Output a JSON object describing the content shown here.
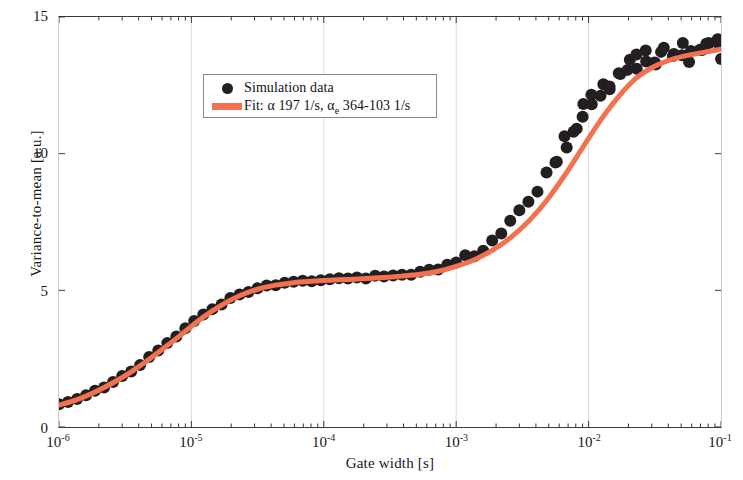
{
  "figure": {
    "background_color": "#ffffff",
    "frame_color": "#3a3a3a",
    "grid_color": "#dddddd"
  },
  "legend": {
    "position": "upper-left-inset",
    "entries": [
      {
        "key": "marker-dot",
        "label": "Simulation data",
        "color": "#231f20"
      },
      {
        "key": "line-swatch",
        "label": "Fit: α  197 1/s, α",
        "label_sub": "e",
        "label_tail": "  364-103 1/s",
        "color": "#F4714F"
      }
    ]
  },
  "chart_data": {
    "type": "scatter",
    "title": "",
    "subtitle": "",
    "xlabel": "Gate width [s]",
    "ylabel": "Variance-to-mean [a.u.]",
    "xscale": "log",
    "yscale": "linear",
    "xlim": [
      1e-06,
      0.1
    ],
    "ylim": [
      0,
      15
    ],
    "grid": "minor-vertical-faint",
    "xticks": [
      1e-06,
      1e-05,
      0.0001,
      0.001,
      0.01,
      0.1
    ],
    "xtick_labels": [
      "10-6",
      "10-5",
      "10-4",
      "10-3",
      "10-2",
      "10-1"
    ],
    "xtick_mantissa": [
      "10",
      "10",
      "10",
      "10",
      "10",
      "10"
    ],
    "xtick_exponents": [
      "-6",
      "-5",
      "-4",
      "-3",
      "-2",
      "-1"
    ],
    "yticks": [
      0,
      5,
      10,
      15
    ],
    "ytick_labels": [
      "0",
      "5",
      "10",
      "15"
    ],
    "series": [
      {
        "name": "Simulation data",
        "type": "scatter",
        "marker": "circle",
        "marker_size": 12,
        "color": "#231f20",
        "x": [
          1e-06,
          1.17e-06,
          1.37e-06,
          1.6e-06,
          1.87e-06,
          2.19e-06,
          2.56e-06,
          3e-06,
          3.51e-06,
          4.1e-06,
          4.8e-06,
          5.62e-06,
          6.58e-06,
          7.7e-06,
          9e-06,
          1.05e-05,
          1.23e-05,
          1.44e-05,
          1.69e-05,
          1.97e-05,
          2.31e-05,
          2.7e-05,
          3.16e-05,
          3.7e-05,
          4.33e-05,
          5.06e-05,
          5.92e-05,
          6.93e-05,
          8.11e-05,
          9.49e-05,
          0.000111,
          0.00013,
          0.000152,
          0.000178,
          0.000208,
          0.000244,
          0.000285,
          0.000334,
          0.00039,
          0.000457,
          0.000534,
          0.000625,
          0.000731,
          0.000856,
          0.001,
          0.00117,
          0.00137,
          0.0016,
          0.00187,
          0.00219,
          0.00256,
          0.003,
          0.00351,
          0.00411,
          0.00481,
          0.00562,
          0.00658,
          0.0077,
          0.00901,
          0.0105,
          0.0123,
          0.0144,
          0.0169,
          0.0197,
          0.0231,
          0.027,
          0.0316,
          0.037,
          0.0433,
          0.0506,
          0.0592,
          0.0693,
          0.0811,
          0.0949,
          0.1
        ],
        "y": [
          0.85,
          0.95,
          1.05,
          1.18,
          1.32,
          1.48,
          1.65,
          1.85,
          2.05,
          2.28,
          2.52,
          2.78,
          3.05,
          3.32,
          3.58,
          3.85,
          4.08,
          4.3,
          4.5,
          4.68,
          4.83,
          4.96,
          5.06,
          5.14,
          5.2,
          5.25,
          5.29,
          5.32,
          5.35,
          5.37,
          5.39,
          5.41,
          5.43,
          5.45,
          5.47,
          5.49,
          5.51,
          5.54,
          5.57,
          5.61,
          5.66,
          5.72,
          5.8,
          5.9,
          6.02,
          6.17,
          6.35,
          6.57,
          6.83,
          7.12,
          7.46,
          7.84,
          8.27,
          8.74,
          9.25,
          9.8,
          10.35,
          10.92,
          11.45,
          11.95,
          12.38,
          12.72,
          13.0,
          13.2,
          13.35,
          13.48,
          13.55,
          13.62,
          13.66,
          13.7,
          13.73,
          13.76,
          13.78,
          13.82,
          13.85
        ],
        "noise_note": "scatter spread increases for x > 1e-2; points jitter about the fit by up to +/- 0.45"
      },
      {
        "name": "Fit",
        "type": "line",
        "color": "#F4714F",
        "linewidth": 5,
        "alpha_param": "197 1/s",
        "alpha_e_param": "364-103 1/s",
        "x": [
          1e-06,
          1.37e-06,
          1.87e-06,
          2.56e-06,
          3.51e-06,
          4.8e-06,
          6.58e-06,
          9e-06,
          1.23e-05,
          1.69e-05,
          2.31e-05,
          3.16e-05,
          4.33e-05,
          5.92e-05,
          8.11e-05,
          0.000111,
          0.000152,
          0.000208,
          0.000285,
          0.00039,
          0.000534,
          0.000731,
          0.001,
          0.00137,
          0.00187,
          0.00256,
          0.00351,
          0.00481,
          0.00658,
          0.00901,
          0.0123,
          0.0169,
          0.0231,
          0.0316,
          0.0433,
          0.0592,
          0.0811,
          0.1
        ],
        "y": [
          0.8,
          1.0,
          1.28,
          1.62,
          2.02,
          2.48,
          2.98,
          3.5,
          4.02,
          4.46,
          4.8,
          5.04,
          5.19,
          5.28,
          5.33,
          5.37,
          5.4,
          5.43,
          5.47,
          5.52,
          5.59,
          5.7,
          5.88,
          6.12,
          6.46,
          6.92,
          7.52,
          8.28,
          9.2,
          10.22,
          11.22,
          12.1,
          12.78,
          13.2,
          13.46,
          13.62,
          13.74,
          13.82
        ]
      }
    ]
  }
}
